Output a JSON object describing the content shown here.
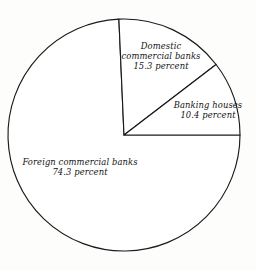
{
  "chart_data": {
    "type": "pie",
    "title": "",
    "subtitle": "",
    "xlabel": "",
    "ylabel": "",
    "legend_position": "none",
    "grid": false,
    "value_unit": "percent",
    "total": 100.0,
    "categories": [
      "Banking houses",
      "Domestic commercial banks",
      "Foreign commercial banks"
    ],
    "values": [
      10.4,
      15.3,
      74.3
    ],
    "slices": [
      {
        "label": "Banking houses",
        "value": 10.4,
        "value_text": "10.4 percent",
        "start_angle_deg": 0.0,
        "end_angle_deg": 37.44,
        "fill": "#ffffff",
        "stroke": "#1a1a1a"
      },
      {
        "label": "Domestic commercial banks",
        "value": 15.3,
        "value_text": "15.3 percent",
        "start_angle_deg": 37.44,
        "end_angle_deg": 92.52,
        "fill": "#ffffff",
        "stroke": "#1a1a1a"
      },
      {
        "label": "Foreign commercial banks",
        "value": 74.3,
        "value_text": "74.3 percent",
        "start_angle_deg": 92.52,
        "end_angle_deg": 360.0,
        "fill": "#ffffff",
        "stroke": "#1a1a1a"
      }
    ]
  },
  "labels": {
    "domestic": {
      "line1": "Domestic",
      "line2": "commercial banks",
      "line3": "15.3 percent"
    },
    "banking": {
      "line1": "Banking houses",
      "line2": "10.4 percent"
    },
    "foreign": {
      "line1": "Foreign commercial banks",
      "line2": "74.3 percent"
    }
  },
  "colors": {
    "background": "#fdfdfc",
    "outline": "#1a1a1a",
    "slice_fill": "#ffffff",
    "text": "#131313"
  }
}
